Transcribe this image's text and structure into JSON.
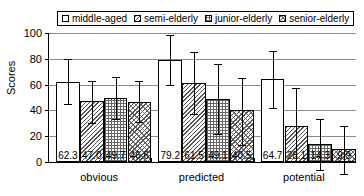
{
  "chart_data": {
    "type": "bar",
    "title": "",
    "xlabel": "",
    "ylabel": "Scores",
    "ylim": [
      0,
      100
    ],
    "yticks": [
      0,
      20,
      40,
      60,
      80,
      100
    ],
    "grid": true,
    "legend_position": "top",
    "categories": [
      "obvious",
      "predicted",
      "potential"
    ],
    "series": [
      {
        "name": "middle-aged",
        "pattern": "plain",
        "values": [
          62.3,
          79.2,
          64.7
        ],
        "err_upper": [
          80.0,
          98.5,
          86.0
        ],
        "err_lower": [
          45.0,
          59.5,
          41.5
        ]
      },
      {
        "name": "semi-elderly",
        "pattern": "diagonal-hatch",
        "values": [
          47.0,
          61.5,
          28.1
        ],
        "err_upper": [
          63.0,
          85.0,
          57.0
        ],
        "err_lower": [
          30.5,
          37.0,
          0.0
        ]
      },
      {
        "name": "junior-elderly",
        "pattern": "grid-dots",
        "values": [
          49.7,
          49.1,
          14.3
        ],
        "err_upper": [
          66.0,
          76.0,
          33.0
        ],
        "err_lower": [
          33.0,
          21.5,
          -6.0
        ]
      },
      {
        "name": "senior-elderly",
        "pattern": "cross-hatch",
        "values": [
          46.6,
          40.5,
          9.9
        ],
        "err_upper": [
          62.5,
          65.5,
          28.0
        ],
        "err_lower": [
          31.0,
          13.5,
          -9.0
        ]
      }
    ]
  },
  "legend": {
    "items": [
      {
        "label": "middle-aged",
        "pattern": "plain"
      },
      {
        "label": "semi-elderly",
        "pattern": "diagonal-hatch"
      },
      {
        "label": "junior-elderly",
        "pattern": "grid-dots"
      },
      {
        "label": "senior-elderly",
        "pattern": "cross-hatch"
      }
    ]
  },
  "colors": {
    "axis": "#000000",
    "gridline": "#8a8a8a",
    "background": "#ffffff"
  }
}
